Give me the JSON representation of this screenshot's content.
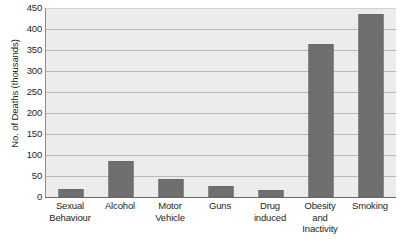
{
  "chart_data": {
    "type": "bar",
    "title": "",
    "subtitle": "",
    "xlabel": "",
    "ylabel": "No. of Deaths (thousands)",
    "ylim": [
      0,
      450
    ],
    "yticks": [
      0,
      50,
      100,
      150,
      200,
      250,
      300,
      350,
      400,
      450
    ],
    "ytick_labels": [
      "0",
      "50",
      "100",
      "150",
      "200",
      "250",
      "300",
      "350",
      "400",
      "450"
    ],
    "grid": "horizontal",
    "legend": "none",
    "orientation": "vertical",
    "bar_color": "#6f6f70",
    "plot_background": "#ececed",
    "gridline_color": "#b9b9ba",
    "categories": [
      "Sexual Behaviour",
      "Alcohol",
      "Motor Vehicle",
      "Guns",
      "Drug induced",
      "Obesity and Inactivity",
      "Smoking"
    ],
    "category_lines": [
      [
        "Sexual",
        "Behaviour"
      ],
      [
        "Alcohol"
      ],
      [
        "Motor",
        "Vehicle"
      ],
      [
        "Guns"
      ],
      [
        "Drug",
        "induced"
      ],
      [
        "Obesity",
        "and",
        "Inactivity"
      ],
      [
        "Smoking"
      ]
    ],
    "values": [
      20,
      85,
      43,
      27,
      17,
      365,
      435
    ]
  }
}
